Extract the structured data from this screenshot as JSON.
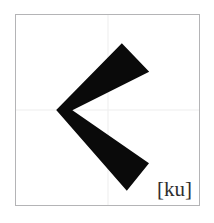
{
  "card": {
    "background_color": "#ffffff",
    "box_border_color": "#b4b4b6",
    "guide_line_color": "#ededee"
  },
  "glyph": {
    "name": "katakana-ku",
    "character": "ク",
    "stroke_color": "#0a0a0a",
    "stroke_count": 1,
    "description": "angular chevron stroke pointing left",
    "path": "M 107 30 L 133 57 L 55 96 L 133 150 L 112 176 L 42 96 Z"
  },
  "reading": {
    "label": "[ku]",
    "romanization": "ku",
    "color": "#2e2e2e"
  }
}
